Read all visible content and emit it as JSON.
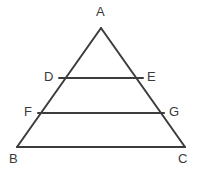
{
  "figure": {
    "type": "geometry-diagram",
    "background_color": "#ffffff",
    "stroke_color": "#3c3c3c",
    "label_color": "#3a3a3a",
    "stroke_width": 2,
    "points": {
      "A": {
        "label": "A",
        "x": 101,
        "y": 28,
        "label_x": 96,
        "label_y": 5
      },
      "B": {
        "label": "B",
        "x": 17,
        "y": 147,
        "label_x": 9,
        "label_y": 152
      },
      "C": {
        "label": "C",
        "x": 185,
        "y": 147,
        "label_x": 178,
        "label_y": 152
      },
      "D": {
        "label": "D",
        "x": 59,
        "y": 78,
        "label_x": 44,
        "label_y": 70
      },
      "E": {
        "label": "E",
        "x": 143,
        "y": 78,
        "label_x": 147,
        "label_y": 70
      },
      "F": {
        "label": "F",
        "x": 38,
        "y": 113,
        "label_x": 24,
        "label_y": 105
      },
      "G": {
        "label": "G",
        "x": 164,
        "y": 113,
        "label_x": 169,
        "label_y": 105
      }
    },
    "segments": [
      {
        "name": "side-AB",
        "from": "A",
        "to": "B"
      },
      {
        "name": "side-AC",
        "from": "A",
        "to": "C"
      },
      {
        "name": "base-BC",
        "from": "B",
        "to": "C"
      },
      {
        "name": "segment-DE",
        "from": "D",
        "to": "E"
      },
      {
        "name": "segment-FG",
        "from": "F",
        "to": "G"
      }
    ]
  }
}
